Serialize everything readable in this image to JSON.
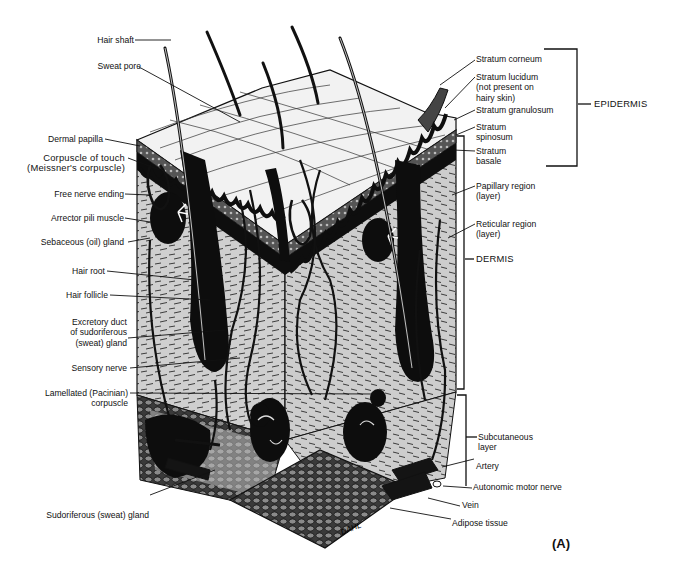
{
  "figure": {
    "panel_label": "(A)",
    "signature": "DAHL",
    "colors": {
      "ink": "#111111",
      "dermis": "#c9c9c9",
      "epidermis": "#e9e9e9",
      "background": "#ffffff"
    }
  },
  "labels_left": [
    {
      "id": "hair-shaft",
      "text": "Hair shaft"
    },
    {
      "id": "sweat-pore",
      "text": "Sweat pore"
    },
    {
      "id": "dermal-papilla",
      "text": "Dermal papilla"
    },
    {
      "id": "corpuscle-of-touch",
      "text": "Corpuscle of touch\n(Meissner's corpuscle)"
    },
    {
      "id": "free-nerve-ending",
      "text": "Free nerve ending"
    },
    {
      "id": "arrector-pili-muscle",
      "text": "Arrector pili muscle"
    },
    {
      "id": "sebaceous-gland",
      "text": "Sebaceous (oil) gland"
    },
    {
      "id": "hair-root",
      "text": "Hair root"
    },
    {
      "id": "hair-follicle",
      "text": "Hair follicle"
    },
    {
      "id": "excretory-duct",
      "text": "Excretory duct\nof sudoriferous\n(sweat) gland"
    },
    {
      "id": "sensory-nerve",
      "text": "Sensory nerve"
    },
    {
      "id": "lamellated-corpuscle",
      "text": "Lamellated (Pacinian)\ncorpuscle"
    },
    {
      "id": "sudoriferous-gland",
      "text": "Sudoriferous (sweat) gland"
    }
  ],
  "labels_right": [
    {
      "id": "stratum-corneum",
      "text": "Stratum corneum"
    },
    {
      "id": "stratum-lucidum",
      "text": "Stratum lucidum\n(not present on\nhairy skin)"
    },
    {
      "id": "stratum-granulosum",
      "text": "Stratum granulosum"
    },
    {
      "id": "stratum-spinosum",
      "text": "Stratum\nspinosum"
    },
    {
      "id": "stratum-basale",
      "text": "Stratum\nbasale"
    },
    {
      "id": "papillary-region",
      "text": "Papillary region\n(layer)"
    },
    {
      "id": "reticular-region",
      "text": "Reticular region\n(layer)"
    },
    {
      "id": "subcutaneous-layer",
      "text": "Subcutaneous\nlayer"
    },
    {
      "id": "artery",
      "text": "Artery"
    },
    {
      "id": "autonomic-motor-nerve",
      "text": "Autonomic motor nerve"
    },
    {
      "id": "vein",
      "text": "Vein"
    },
    {
      "id": "adipose-tissue",
      "text": "Adipose tissue"
    }
  ],
  "regions": [
    {
      "id": "epidermis",
      "text": "EPIDERMIS"
    },
    {
      "id": "dermis",
      "text": "DERMIS"
    }
  ]
}
